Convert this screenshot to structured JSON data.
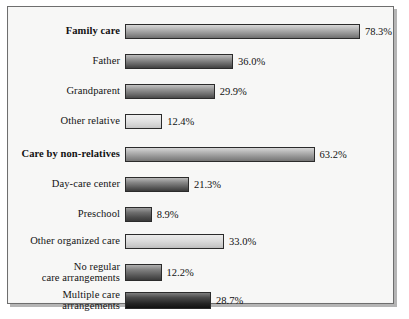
{
  "chart_data": {
    "type": "bar",
    "orientation": "horizontal",
    "title": "",
    "xlabel": "",
    "ylabel": "",
    "xlim": [
      0,
      80
    ],
    "grid": false,
    "legend": null,
    "value_suffix": "%",
    "categories": [
      "Family care",
      "Father",
      "Grandparent",
      "Other relative",
      "Care by non-relatives",
      "Day-care center",
      "Preschool",
      "Other organized care",
      "No regular care arrangements",
      "Multiple care arrangements"
    ],
    "values": [
      78.3,
      36.0,
      29.9,
      12.4,
      63.2,
      21.3,
      8.9,
      33.0,
      12.2,
      28.7
    ],
    "value_labels": [
      "78.3%",
      "36.0%",
      "29.9%",
      "12.4%",
      "63.2%",
      "21.3%",
      "8.9%",
      "33.0%",
      "12.2%",
      "28.7%"
    ],
    "bars": [
      {
        "label_line1": "Family care",
        "label_line2": "",
        "value": 78.3,
        "value_label": "78.3%",
        "bold": true,
        "shade": "sh-1"
      },
      {
        "label_line1": "Father",
        "label_line2": "",
        "value": 36.0,
        "value_label": "36.0%",
        "bold": false,
        "shade": "sh-2"
      },
      {
        "label_line1": "Grandparent",
        "label_line2": "",
        "value": 29.9,
        "value_label": "29.9%",
        "bold": false,
        "shade": "sh-3"
      },
      {
        "label_line1": "Other relative",
        "label_line2": "",
        "value": 12.4,
        "value_label": "12.4%",
        "bold": false,
        "shade": "sh-4"
      },
      {
        "label_line1": "Care by non-relatives",
        "label_line2": "",
        "value": 63.2,
        "value_label": "63.2%",
        "bold": true,
        "shade": "sh-5"
      },
      {
        "label_line1": "Day-care center",
        "label_line2": "",
        "value": 21.3,
        "value_label": "21.3%",
        "bold": false,
        "shade": "sh-6"
      },
      {
        "label_line1": "Preschool",
        "label_line2": "",
        "value": 8.9,
        "value_label": "8.9%",
        "bold": false,
        "shade": "sh-7"
      },
      {
        "label_line1": "Other organized care",
        "label_line2": "",
        "value": 33.0,
        "value_label": "33.0%",
        "bold": false,
        "shade": "sh-8"
      },
      {
        "label_line1": "No regular",
        "label_line2": "care arrangements",
        "value": 12.2,
        "value_label": "12.2%",
        "bold": false,
        "shade": "sh-9"
      },
      {
        "label_line1": "Multiple care",
        "label_line2": "arrangements",
        "value": 28.7,
        "value_label": "28.7%",
        "bold": false,
        "shade": "sh-10"
      }
    ],
    "colors": {
      "background": "#f7f7f6",
      "frame_border": "#6e6e6e",
      "bar_border": "#2b2b2b",
      "text": "#121212"
    }
  }
}
